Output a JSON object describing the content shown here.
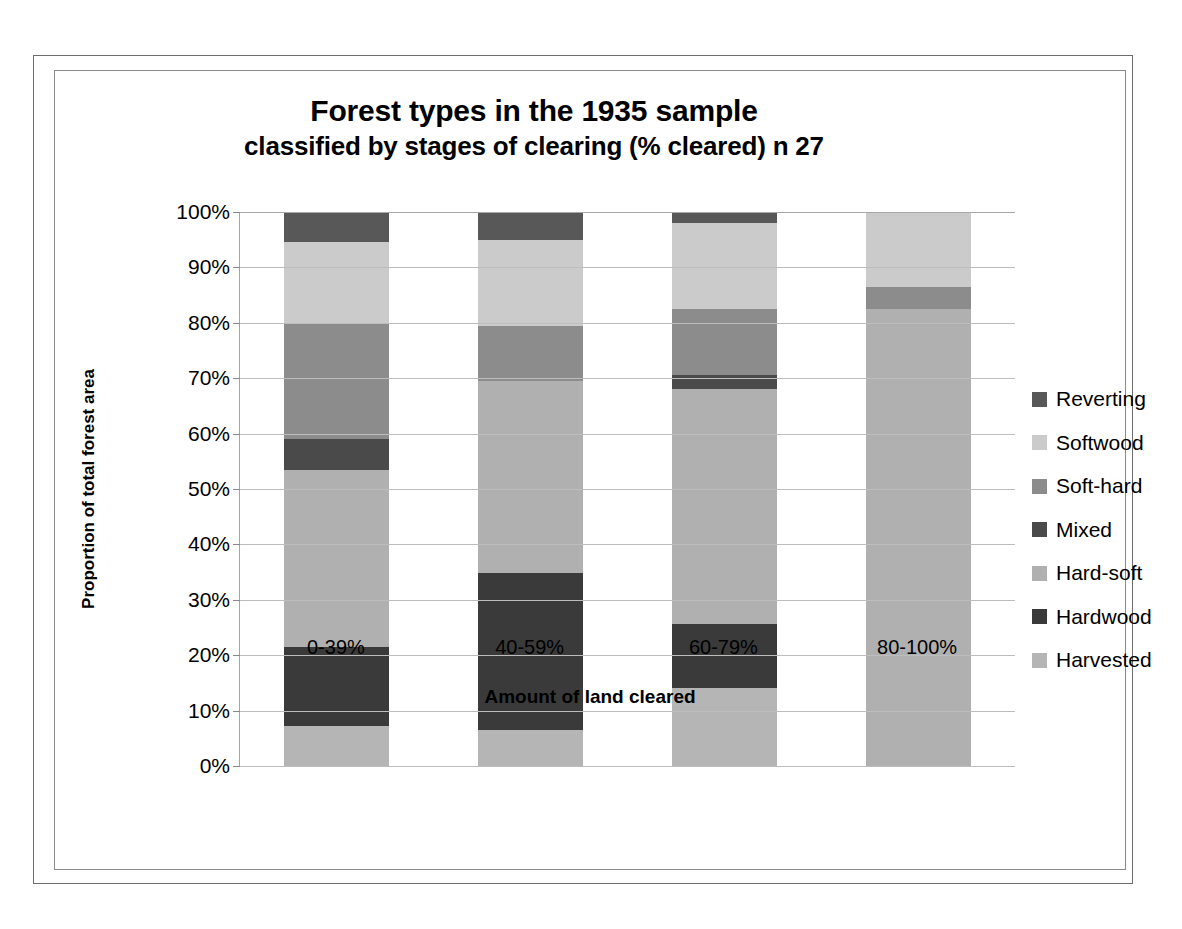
{
  "chart_data": {
    "type": "bar",
    "subtype": "stacked-100-percent",
    "title": "Forest types in the 1935 sample",
    "subtitle": "classified by stages of clearing (% cleared) n 27",
    "title_lines": [
      "Forest types in the 1935 sample",
      "classified by stages of clearing (% cleared) n 27"
    ],
    "xlabel": "Amount of land cleared",
    "ylabel": "Proportion of total forest area",
    "categories": [
      "0-39%",
      "40-59%",
      "60-79%",
      "80-100%"
    ],
    "ylim": [
      0,
      100
    ],
    "ytick_labels": [
      "0%",
      "10%",
      "20%",
      "30%",
      "40%",
      "50%",
      "60%",
      "70%",
      "80%",
      "90%",
      "100%"
    ],
    "ytick_values": [
      0,
      10,
      20,
      30,
      40,
      50,
      60,
      70,
      80,
      90,
      100
    ],
    "grid": true,
    "legend_position": "right",
    "legend_order_top_to_bottom": [
      "Reverting",
      "Softwood",
      "Soft-hard",
      "Mixed",
      "Hard-soft",
      "Hardwood",
      "Harvested"
    ],
    "series": [
      {
        "name": "Harvested",
        "color": "#b5b5b5",
        "values": [
          7.2,
          6.5,
          14.1,
          0
        ]
      },
      {
        "name": "Hardwood",
        "color": "#3a3a3a",
        "values": [
          14.3,
          28.4,
          11.5,
          0
        ]
      },
      {
        "name": "Hard-soft",
        "color": "#b0b0b0",
        "values": [
          32.0,
          34.6,
          42.4,
          82.5
        ]
      },
      {
        "name": "Mixed",
        "color": "#4a4a4a",
        "values": [
          5.5,
          0,
          2.5,
          0
        ]
      },
      {
        "name": "Soft-hard",
        "color": "#8c8c8c",
        "values": [
          21.0,
          10.0,
          12.0,
          4.0
        ]
      },
      {
        "name": "Softwood",
        "color": "#cbcbcb",
        "values": [
          14.5,
          15.5,
          15.5,
          13.5
        ]
      },
      {
        "name": "Reverting",
        "color": "#585858",
        "values": [
          5.5,
          5.0,
          2.0,
          0
        ]
      }
    ]
  },
  "legend": {
    "items": [
      {
        "label": "Reverting",
        "color": "#585858"
      },
      {
        "label": "Softwood",
        "color": "#cbcbcb"
      },
      {
        "label": "Soft-hard",
        "color": "#8c8c8c"
      },
      {
        "label": "Mixed",
        "color": "#4a4a4a"
      },
      {
        "label": "Hard-soft",
        "color": "#b0b0b0"
      },
      {
        "label": "Hardwood",
        "color": "#3a3a3a"
      },
      {
        "label": "Harvested",
        "color": "#b5b5b5"
      }
    ]
  }
}
